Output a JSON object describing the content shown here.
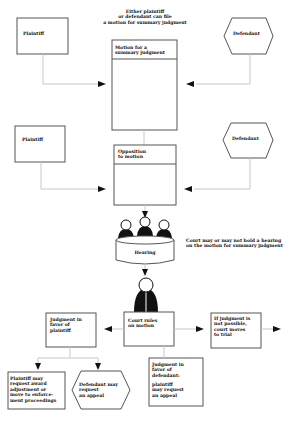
{
  "diagram": {
    "type": "flowchart",
    "title_note": "Either plaintiff\nor defendant can file\na motion for summary judgment",
    "row1": {
      "plaintiff": "Plaintiff",
      "defendant": "Defendant",
      "motion_box": "Motion for a\nsummary judgment"
    },
    "row2": {
      "plaintiff": "Plaintiff",
      "defendant": "Defendant",
      "opposition_box": "Opposition\nto motion"
    },
    "hearing": {
      "label": "Hearing",
      "note": "Court may or may not hold a hearing\non the motion for summary judgment"
    },
    "ruling": {
      "label": "Court rules\non motion"
    },
    "outcomes": {
      "plaintiff_win": "Judgment in\nfavor of\nplaintiff",
      "trial": "If judgment is\nnot possible,\ncourt moves\nto trial",
      "defendant_win": "Judgment in\nfavor of\ndefendant:",
      "defendant_win_sub": "plaintiff\nmay request\nan appeal",
      "plaintiff_enforce": "Plaintiff may\nrequest award\nadjustment or\nmove to enforce-\nment proceedings",
      "defendant_appeal": "Defendant may\nrequest\nan appeal"
    },
    "colors": {
      "box_stroke": "#555555",
      "connector": "#c8c8c8",
      "arrow": "#111111",
      "text": "#111111"
    }
  }
}
